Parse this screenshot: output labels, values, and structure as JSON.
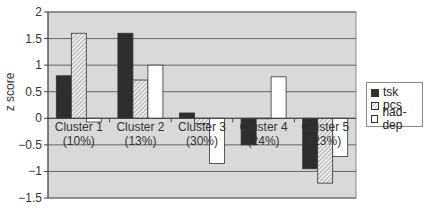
{
  "chart_data": {
    "type": "bar",
    "title": "",
    "xlabel": "",
    "ylabel": "z score",
    "ylim": [
      -1.5,
      2
    ],
    "yticks": [
      2,
      1.5,
      1,
      0.5,
      0,
      -0.5,
      -1,
      -1.5
    ],
    "ytick_labels": [
      "2",
      "1.5",
      "1",
      "0.5",
      "0",
      "−0.5",
      "−1",
      "−1.5"
    ],
    "grid": true,
    "legend_position": "right",
    "categories": [
      "Cluster 1 (10%)",
      "Cluster 2 (13%)",
      "Cluster 3 (30%)",
      "Cluster 4 (24%)",
      "Cluster 5 (23%)"
    ],
    "category_lines": [
      [
        "Cluster 1",
        "(10%)"
      ],
      [
        "Cluster 2",
        "(13%)"
      ],
      [
        "Cluster 3",
        "(30%)"
      ],
      [
        "Cluster 4",
        "(24%)"
      ],
      [
        "Cluster 5",
        "(23%)"
      ]
    ],
    "series": [
      {
        "name": "tsk",
        "fill": "solid-dark",
        "values": [
          0.8,
          1.6,
          0.1,
          -0.5,
          -0.95
        ]
      },
      {
        "name": "pcs",
        "fill": "hatched",
        "values": [
          1.6,
          0.72,
          -0.1,
          0.0,
          -1.22
        ]
      },
      {
        "name": "had-dep",
        "fill": "white",
        "values": [
          -0.07,
          1.0,
          -0.85,
          0.78,
          -0.72
        ]
      }
    ]
  },
  "legend": {
    "items": [
      {
        "label": "tsk"
      },
      {
        "label": "pcs"
      },
      {
        "label": "had-dep"
      }
    ]
  },
  "colors": {
    "plot_bg": "#d9d9d9",
    "grid": "#666666",
    "tsk": "#2e2e2e",
    "pcs_hatch": "#9a9a9a",
    "had_dep": "#ffffff"
  }
}
